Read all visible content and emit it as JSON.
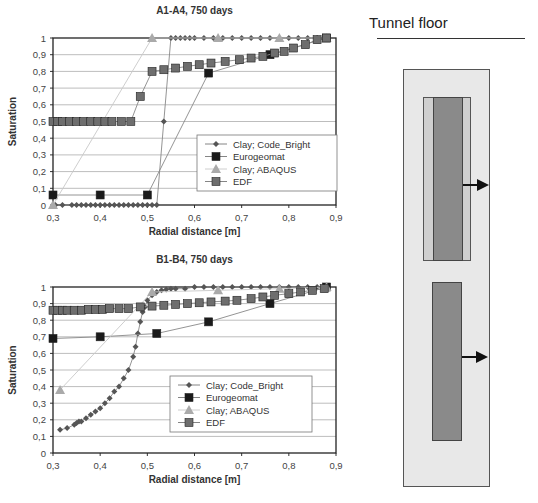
{
  "chart_data": [
    {
      "type": "line",
      "title": "A1-A4, 750 days",
      "xlabel": "Radial distance [m]",
      "ylabel": "Saturation",
      "xlim": [
        0.3,
        0.9
      ],
      "ylim": [
        0,
        1
      ],
      "xticks": [
        "0,3",
        "0,4",
        "0,5",
        "0,6",
        "0,7",
        "0,8",
        "0,9"
      ],
      "yticks": [
        "0",
        "0,1",
        "0,2",
        "0,3",
        "0,4",
        "0,5",
        "0,6",
        "0,7",
        "0,8",
        "0,9",
        "1"
      ],
      "grid": "horizontal",
      "legend_position": "inside-right-middle",
      "series": [
        {
          "name": "Clay; Code_Bright",
          "marker": "diamond",
          "color": "#555555",
          "x": [
            0.305,
            0.32,
            0.34,
            0.35,
            0.36,
            0.37,
            0.38,
            0.39,
            0.4,
            0.41,
            0.42,
            0.43,
            0.44,
            0.45,
            0.46,
            0.47,
            0.48,
            0.49,
            0.5,
            0.51,
            0.52,
            0.535,
            0.55,
            0.56,
            0.57,
            0.58,
            0.59,
            0.6,
            0.62,
            0.64,
            0.66,
            0.68,
            0.7,
            0.72,
            0.74,
            0.76,
            0.78,
            0.8,
            0.82,
            0.84,
            0.86,
            0.88
          ],
          "y": [
            0,
            0,
            0,
            0,
            0,
            0,
            0,
            0,
            0,
            0,
            0,
            0,
            0,
            0,
            0,
            0,
            0,
            0,
            0,
            0,
            0,
            0.5,
            1,
            1,
            1,
            1,
            1,
            1,
            1,
            1,
            1,
            1,
            1,
            1,
            1,
            1,
            1,
            1,
            1,
            1,
            1,
            1
          ]
        },
        {
          "name": "Eurogeomat",
          "marker": "square",
          "color": "#1a1a1a",
          "x": [
            0.3,
            0.4,
            0.5,
            0.63,
            0.76,
            0.88
          ],
          "y": [
            0.06,
            0.06,
            0.06,
            0.79,
            0.9,
            1.0
          ]
        },
        {
          "name": "Clay; ABAQUS",
          "marker": "triangle",
          "color": "#aaaaaa",
          "x": [
            0.3,
            0.51,
            0.65,
            0.78,
            0.88
          ],
          "y": [
            0,
            1,
            1,
            1,
            1
          ]
        },
        {
          "name": "EDF",
          "marker": "square",
          "color": "#6e6e6e",
          "x": [
            0.3,
            0.31,
            0.32,
            0.335,
            0.35,
            0.365,
            0.38,
            0.395,
            0.41,
            0.425,
            0.445,
            0.465,
            0.485,
            0.51,
            0.535,
            0.56,
            0.585,
            0.61,
            0.635,
            0.665,
            0.695,
            0.72,
            0.745,
            0.77,
            0.79,
            0.81,
            0.835,
            0.86,
            0.88
          ],
          "y": [
            0.5,
            0.5,
            0.5,
            0.5,
            0.5,
            0.5,
            0.5,
            0.5,
            0.5,
            0.5,
            0.5,
            0.5,
            0.65,
            0.8,
            0.81,
            0.82,
            0.83,
            0.84,
            0.85,
            0.86,
            0.87,
            0.88,
            0.89,
            0.91,
            0.92,
            0.94,
            0.96,
            0.99,
            1.0
          ]
        }
      ]
    },
    {
      "type": "line",
      "title": "B1-B4, 750 days",
      "xlabel": "Radial distance [m]",
      "ylabel": "Saturation",
      "xlim": [
        0.3,
        0.9
      ],
      "ylim": [
        0,
        1
      ],
      "xticks": [
        "0,3",
        "0,4",
        "0,5",
        "0,6",
        "0,7",
        "0,8",
        "0,9"
      ],
      "yticks": [
        "0",
        "0,1",
        "0,2",
        "0,3",
        "0,4",
        "0,5",
        "0,6",
        "0,7",
        "0,8",
        "0,9",
        "1"
      ],
      "grid": "horizontal",
      "legend_position": "inside-right-lower",
      "series": [
        {
          "name": "Clay; Code_Bright",
          "marker": "diamond",
          "color": "#555555",
          "x": [
            0.315,
            0.33,
            0.345,
            0.35,
            0.355,
            0.36,
            0.37,
            0.38,
            0.39,
            0.4,
            0.41,
            0.42,
            0.43,
            0.44,
            0.45,
            0.46,
            0.47,
            0.475,
            0.48,
            0.485,
            0.49,
            0.495,
            0.5,
            0.51,
            0.52,
            0.53,
            0.54,
            0.55,
            0.56,
            0.58,
            0.6,
            0.62,
            0.64,
            0.66,
            0.68,
            0.7,
            0.72,
            0.74,
            0.76,
            0.78,
            0.8,
            0.82,
            0.84,
            0.86,
            0.88
          ],
          "y": [
            0.14,
            0.15,
            0.17,
            0.18,
            0.19,
            0.19,
            0.21,
            0.23,
            0.25,
            0.27,
            0.3,
            0.33,
            0.37,
            0.4,
            0.45,
            0.5,
            0.58,
            0.64,
            0.72,
            0.79,
            0.85,
            0.88,
            0.92,
            0.95,
            0.97,
            0.98,
            0.985,
            0.99,
            0.99,
            0.99,
            1,
            1,
            1,
            1,
            1,
            1,
            1,
            1,
            1,
            1,
            1,
            1,
            1,
            1,
            1
          ]
        },
        {
          "name": "Eurogeomat",
          "marker": "square",
          "color": "#1a1a1a",
          "x": [
            0.3,
            0.4,
            0.52,
            0.63,
            0.76,
            0.88
          ],
          "y": [
            0.69,
            0.7,
            0.72,
            0.79,
            0.9,
            1.0
          ]
        },
        {
          "name": "Clay; ABAQUS",
          "marker": "triangle",
          "color": "#aaaaaa",
          "x": [
            0.315,
            0.51,
            0.65,
            0.78,
            0.88
          ],
          "y": [
            0.38,
            0.97,
            0.98,
            0.99,
            1.0
          ]
        },
        {
          "name": "EDF",
          "marker": "square",
          "color": "#6e6e6e",
          "x": [
            0.3,
            0.31,
            0.32,
            0.33,
            0.345,
            0.36,
            0.375,
            0.39,
            0.405,
            0.42,
            0.44,
            0.46,
            0.485,
            0.51,
            0.535,
            0.56,
            0.585,
            0.61,
            0.635,
            0.665,
            0.69,
            0.72,
            0.745,
            0.77,
            0.8,
            0.825,
            0.85,
            0.875
          ],
          "y": [
            0.86,
            0.86,
            0.86,
            0.86,
            0.86,
            0.86,
            0.865,
            0.865,
            0.865,
            0.87,
            0.87,
            0.87,
            0.88,
            0.885,
            0.89,
            0.895,
            0.9,
            0.905,
            0.91,
            0.915,
            0.92,
            0.93,
            0.94,
            0.95,
            0.96,
            0.97,
            0.98,
            0.99
          ]
        }
      ]
    }
  ],
  "diagram": {
    "title": "Tunnel floor"
  }
}
